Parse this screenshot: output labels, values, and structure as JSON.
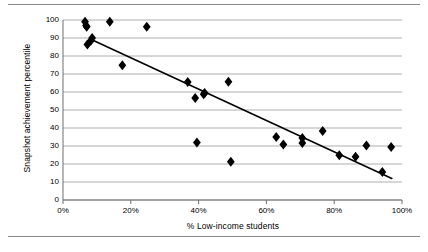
{
  "figure": {
    "background": "#ffffff",
    "rule_color": "#8a8a8a",
    "has_top_rule": true,
    "has_bottom_rule": true
  },
  "chart_data": {
    "type": "scatter",
    "title": "",
    "xlabel": "% Low-income students",
    "ylabel": "Snapshot achievement percentile",
    "xlim": [
      0,
      100
    ],
    "ylim": [
      0,
      100
    ],
    "xticks": [
      0,
      20,
      40,
      60,
      80,
      100
    ],
    "xtick_labels": [
      "0%",
      "20%",
      "40%",
      "60%",
      "80%",
      "100%"
    ],
    "yticks": [
      0,
      10,
      20,
      30,
      40,
      50,
      60,
      70,
      80,
      90,
      100
    ],
    "ytick_labels": [
      "0",
      "10",
      "20",
      "30",
      "40",
      "50",
      "60",
      "70",
      "80",
      "90",
      "100"
    ],
    "grid": "horizontal",
    "grid_color": "#9a9a9a",
    "axis_color": "#6f6f6f",
    "legend": null,
    "marker": "diamond",
    "marker_color": "#000000",
    "marker_size": 5,
    "points": [
      {
        "x": 6.5,
        "y": 99.0
      },
      {
        "x": 6.8,
        "y": 97.0
      },
      {
        "x": 7.0,
        "y": 96.2
      },
      {
        "x": 13.8,
        "y": 99.0
      },
      {
        "x": 24.7,
        "y": 96.3
      },
      {
        "x": 8.6,
        "y": 90.0
      },
      {
        "x": 8.2,
        "y": 88.5
      },
      {
        "x": 7.2,
        "y": 86.4
      },
      {
        "x": 17.5,
        "y": 74.8
      },
      {
        "x": 36.8,
        "y": 65.5
      },
      {
        "x": 48.8,
        "y": 65.7
      },
      {
        "x": 39.0,
        "y": 56.7
      },
      {
        "x": 41.5,
        "y": 58.8
      },
      {
        "x": 41.8,
        "y": 59.5
      },
      {
        "x": 62.9,
        "y": 35.0
      },
      {
        "x": 65.0,
        "y": 30.8
      },
      {
        "x": 70.6,
        "y": 34.4
      },
      {
        "x": 70.6,
        "y": 31.6
      },
      {
        "x": 76.6,
        "y": 38.3
      },
      {
        "x": 39.5,
        "y": 32.0
      },
      {
        "x": 49.5,
        "y": 21.2
      },
      {
        "x": 81.5,
        "y": 24.9
      },
      {
        "x": 86.3,
        "y": 24.0
      },
      {
        "x": 89.5,
        "y": 30.3
      },
      {
        "x": 96.8,
        "y": 29.4
      },
      {
        "x": 94.2,
        "y": 15.5
      }
    ],
    "trendline": {
      "type": "linear",
      "color": "#000000",
      "width": 1.6,
      "x_start": 8.5,
      "y_start": 89.0,
      "x_end": 97.0,
      "y_end": 12.0
    }
  }
}
